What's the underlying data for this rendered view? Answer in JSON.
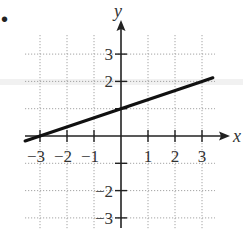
{
  "bullet": "•",
  "chart_data": {
    "type": "line",
    "title": "",
    "xlabel": "x",
    "ylabel": "y",
    "xlim": [
      -3.5,
      3.5
    ],
    "ylim": [
      -3.5,
      3.5
    ],
    "grid": true,
    "grid_style": "dotted",
    "x_ticks": [
      -3,
      -2,
      -1,
      1,
      2,
      3
    ],
    "y_ticks": [
      -3,
      -2,
      -1,
      1,
      2,
      3
    ],
    "x_tick_labels": [
      "−3",
      "−2",
      "−1",
      "1",
      "2",
      "3"
    ],
    "y_tick_labels": [
      "3",
      "2",
      "−2",
      "−3"
    ],
    "series": [
      {
        "name": "y = (1/3)x + 1",
        "equation": "y = x/3 + 1",
        "slope": 0.3333,
        "intercept": 1,
        "x": [
          -3.55,
          -3,
          0,
          3,
          3.4
        ],
        "y": [
          -0.18,
          0,
          1,
          2,
          2.13
        ],
        "color": "#111111"
      }
    ],
    "axis_color": "#222222",
    "grid_color": "#9a9a9a"
  }
}
